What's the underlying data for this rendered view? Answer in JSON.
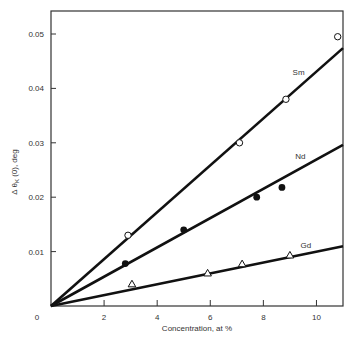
{
  "chart_data": {
    "type": "scatter",
    "title": "",
    "xlabel": "Concentration, at %",
    "ylabel": "Δ θ K (0), deg",
    "ylabel_parts": {
      "prefix": "Δ θ",
      "sub": "K",
      "suffix": " (0), deg"
    },
    "xlim": [
      0,
      11
    ],
    "ylim": [
      0,
      0.055
    ],
    "x_ticks": [
      0,
      2,
      4,
      6,
      8,
      10
    ],
    "x_tick_labels": [
      "0",
      "2",
      "4",
      "6",
      "8",
      "10"
    ],
    "y_ticks": [
      0.01,
      0.02,
      0.03,
      0.04,
      0.05
    ],
    "y_tick_labels": [
      "0.01",
      "0.02",
      "0.03",
      "0.04",
      "0.05"
    ],
    "grid": false,
    "legend": "inline labels",
    "series": [
      {
        "name": "Sm",
        "marker": "open-circle",
        "x": [
          2.9,
          7.1,
          8.85,
          10.8
        ],
        "y": [
          0.013,
          0.03,
          0.038,
          0.0495
        ],
        "fit_line": {
          "x": [
            0,
            11
          ],
          "y": [
            0,
            0.0474
          ]
        },
        "label_pos": {
          "x": 9.1,
          "y": 0.0425
        }
      },
      {
        "name": "Nd",
        "marker": "filled-circle",
        "x": [
          2.8,
          5.0,
          7.75,
          8.7
        ],
        "y": [
          0.0078,
          0.014,
          0.02,
          0.0218
        ],
        "fit_line": {
          "x": [
            0,
            11
          ],
          "y": [
            0,
            0.0296
          ]
        },
        "label_pos": {
          "x": 9.2,
          "y": 0.027
        }
      },
      {
        "name": "Gd",
        "marker": "open-triangle",
        "x": [
          3.05,
          5.9,
          7.2,
          9.0
        ],
        "y": [
          0.004,
          0.006,
          0.0077,
          0.0093
        ],
        "fit_line": {
          "x": [
            0,
            11
          ],
          "y": [
            0,
            0.011
          ]
        },
        "label_pos": {
          "x": 9.4,
          "y": 0.0107
        }
      }
    ]
  },
  "colors": {
    "line": "#111111",
    "axis": "#333333",
    "background": "#ffffff"
  }
}
